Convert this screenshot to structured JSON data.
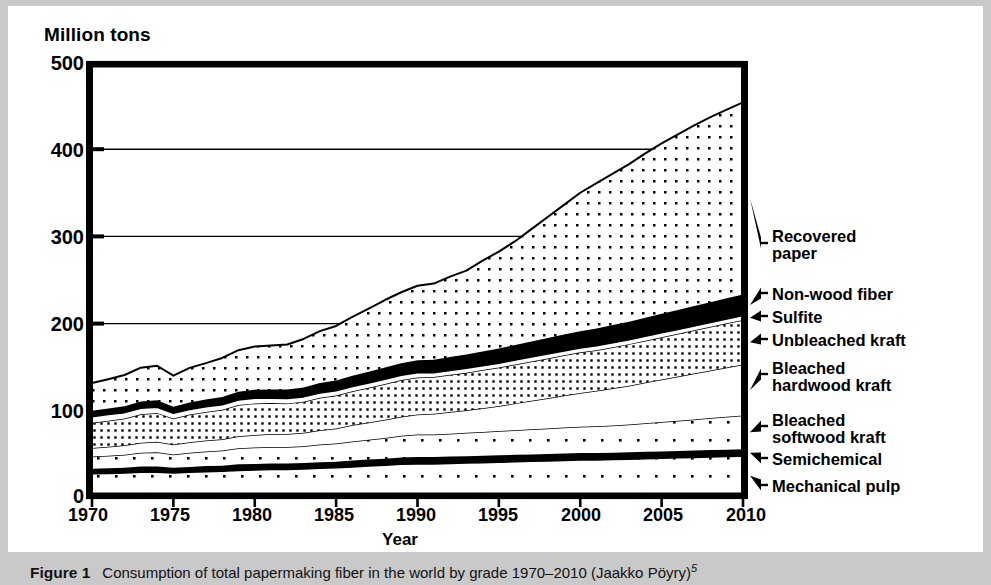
{
  "figure": {
    "number_label": "Figure 1",
    "caption": "Consumption of total papermaking fiber in the world by grade 1970–2010 (Jaakko Pöyry)",
    "caption_superscript": "5"
  },
  "axes": {
    "y_axis_title": "Million tons",
    "x_axis_title": "Year",
    "y_ticks": [
      "0",
      "100",
      "200",
      "300",
      "400",
      "500"
    ],
    "x_ticks": [
      "1970",
      "1975",
      "1980",
      "1985",
      "1990",
      "1995",
      "2000",
      "2005",
      "2010"
    ]
  },
  "legend": {
    "items": [
      {
        "label": "Recovered\npaper",
        "key": "recovered-paper"
      },
      {
        "label": "Non-wood fiber",
        "key": "non-wood-fiber"
      },
      {
        "label": "Sulfite",
        "key": "sulfite"
      },
      {
        "label": "Unbleached kraft",
        "key": "unbleached-kraft"
      },
      {
        "label": "Bleached\nhardwood kraft",
        "key": "bleached-hardwood-kraft"
      },
      {
        "label": "Bleached\nsoftwood kraft",
        "key": "bleached-softwood-kraft"
      },
      {
        "label": "Semichemical",
        "key": "semichemical"
      },
      {
        "label": "Mechanical pulp",
        "key": "mechanical-pulp"
      }
    ]
  },
  "colors": {
    "ink": "#000000",
    "paper": "#ffffff",
    "scan_border": "#c9c9c9",
    "solid_band": "#000000"
  },
  "chart_data": {
    "type": "area",
    "title": "Consumption of total papermaking fiber in the world by grade 1970–2010",
    "xlabel": "Year",
    "ylabel": "Million tons",
    "xlim": [
      1970,
      2010
    ],
    "ylim": [
      0,
      500
    ],
    "grid": "horizontal",
    "stacking": "bottom-to-top",
    "legend_position": "right-outside",
    "x": [
      1970,
      1971,
      1972,
      1973,
      1974,
      1975,
      1976,
      1977,
      1978,
      1979,
      1980,
      1981,
      1982,
      1983,
      1984,
      1985,
      1986,
      1987,
      1988,
      1989,
      1990,
      1991,
      1992,
      1993,
      1994,
      1995,
      1996,
      1997,
      1998,
      1999,
      2000,
      2001,
      2002,
      2003,
      2004,
      2005,
      2006,
      2007,
      2008,
      2009,
      2010
    ],
    "series": [
      {
        "name": "Mechanical pulp",
        "fill": "sparse-dots",
        "values": [
          25,
          25.5,
          26,
          27,
          27,
          26,
          27,
          27.5,
          28,
          29,
          29.5,
          30,
          30,
          30.5,
          31.5,
          32,
          33,
          34,
          35,
          36,
          36.5,
          36.5,
          37,
          37.5,
          38,
          38.5,
          39,
          39.5,
          40,
          40.5,
          41,
          41,
          41.5,
          42,
          42.5,
          43,
          43.5,
          44,
          44.5,
          45,
          45.5
        ]
      },
      {
        "name": "Semichemical",
        "fill": "solid-black",
        "values": [
          6,
          6,
          6,
          6.5,
          6.5,
          6,
          6,
          6.5,
          6.5,
          7,
          7,
          7,
          7,
          7,
          7,
          7,
          7.5,
          7.5,
          7.5,
          8,
          8,
          8,
          8,
          8,
          8,
          8,
          8,
          8,
          8,
          8,
          8,
          8,
          8,
          8,
          8,
          8,
          8,
          8,
          8,
          8,
          8
        ]
      },
      {
        "name": "Bleached softwood kraft",
        "fill": "sparse-dots",
        "values": [
          14,
          14.5,
          15,
          16,
          16.5,
          15.5,
          16.5,
          17,
          17.5,
          18.5,
          19,
          19,
          19,
          19.5,
          20.5,
          21,
          22,
          23,
          24,
          25,
          26,
          26,
          26.5,
          27,
          27.5,
          28,
          28.5,
          29,
          29.5,
          30,
          30.5,
          31,
          31.5,
          32,
          33,
          34,
          35,
          36,
          37,
          38,
          39
        ]
      },
      {
        "name": "Bleached hardwood kraft",
        "fill": "white-blank",
        "values": [
          10,
          10.5,
          11,
          11.5,
          12,
          11.5,
          12,
          12.5,
          13,
          14,
          14.5,
          15,
          15,
          15.5,
          16.5,
          17.5,
          19,
          20,
          21,
          22,
          23,
          24,
          25,
          26,
          27.5,
          29,
          31,
          33,
          35,
          37,
          39,
          41,
          43,
          45,
          47,
          49,
          51,
          53,
          55,
          57,
          59
        ]
      },
      {
        "name": "Unbleached kraft",
        "fill": "dense-dots",
        "values": [
          29,
          30,
          31,
          33,
          33.5,
          30,
          32,
          33,
          34,
          36,
          36.5,
          36,
          35.5,
          36,
          37.5,
          38,
          39,
          40,
          41.5,
          42.5,
          43,
          42.5,
          43,
          43.5,
          44,
          44.5,
          45,
          45.5,
          46,
          46.5,
          47,
          47,
          47.5,
          48,
          48.5,
          49,
          49.5,
          50,
          50.5,
          51,
          51.5
        ]
      },
      {
        "name": "Sulfite",
        "fill": "white-blank",
        "values": [
          7,
          7,
          6.8,
          6.8,
          6.5,
          6,
          6,
          6,
          6,
          6,
          5.8,
          5.5,
          5.5,
          5.5,
          5.5,
          5.5,
          5.5,
          5.5,
          5.5,
          5.5,
          5.5,
          5,
          5,
          5,
          5,
          5,
          5,
          5,
          5,
          5,
          5,
          5,
          5,
          5,
          5,
          5,
          5,
          5,
          5,
          5,
          5
        ]
      },
      {
        "name": "Non-wood fiber",
        "fill": "solid-black",
        "values": [
          7,
          7,
          7.5,
          8,
          8,
          7.5,
          8,
          8.5,
          9,
          9.5,
          10,
          10,
          10.5,
          11,
          11.5,
          12,
          12.5,
          13,
          13.5,
          14,
          14.5,
          15,
          15.5,
          16,
          16.5,
          17,
          17.5,
          18,
          18.5,
          19,
          19.5,
          20,
          20.5,
          21,
          21.5,
          22,
          22.5,
          23,
          23.5,
          24,
          24.5
        ]
      },
      {
        "name": "Recovered paper",
        "fill": "medium-dots",
        "values": [
          32,
          34,
          36,
          39,
          40,
          36,
          40,
          42,
          45,
          48,
          50,
          51,
          52,
          56,
          60,
          63,
          68,
          73,
          78,
          82,
          86,
          88,
          93,
          97,
          105,
          112,
          120,
          130,
          140,
          150,
          160,
          168,
          175,
          182,
          190,
          197,
          203,
          209,
          214,
          218,
          222
        ]
      }
    ],
    "totals": [
      130,
      134.5,
      139.3,
      147.8,
      150,
      138.5,
      147.5,
      152.5,
      159.5,
      168,
      171.8,
      173.5,
      175,
      181,
      188,
      194,
      206.5,
      216.5,
      227,
      237,
      242.5,
      245,
      253,
      260,
      271.5,
      282,
      294,
      308,
      322,
      336,
      350,
      361,
      372.5,
      384,
      398.5,
      410,
      422.5,
      435,
      446.5,
      456,
      464.5
    ]
  }
}
